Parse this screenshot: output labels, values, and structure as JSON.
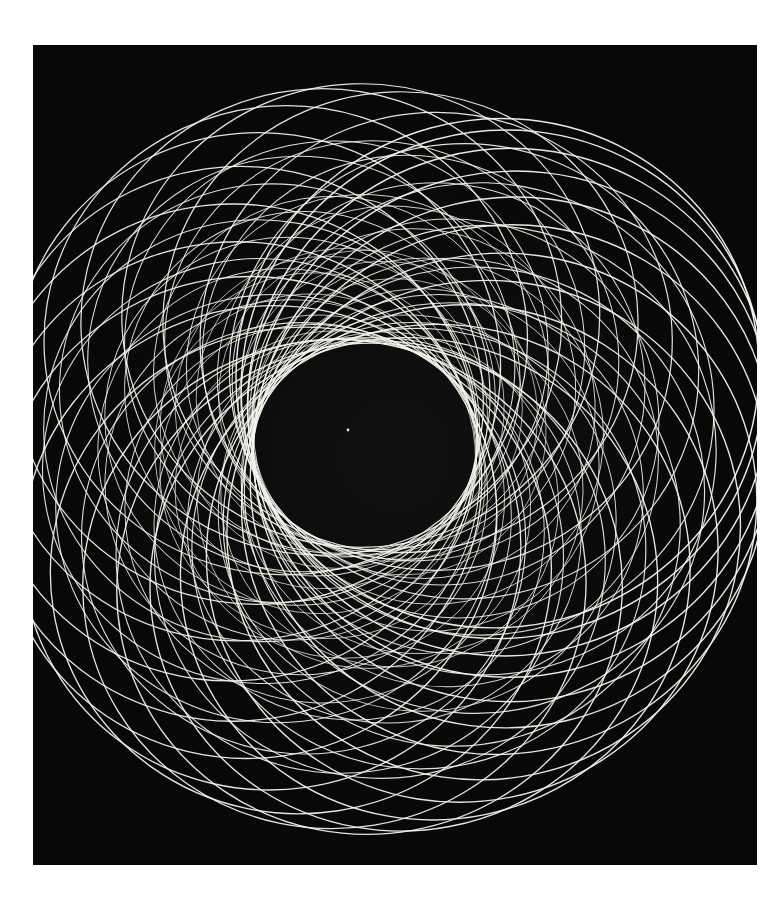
{
  "page": {
    "background_color": "#ffffff",
    "width": 783,
    "height": 897
  },
  "plate": {
    "name": "photographic-print",
    "background_color": "#080808",
    "line_color": "#f5f5f0",
    "x": 33,
    "y": 45,
    "width": 724,
    "height": 820
  },
  "chart_data": {
    "type": "line",
    "title": "",
    "subtitle": "",
    "xlabel": "",
    "ylabel": "",
    "grid": false,
    "legend_position": "none",
    "curve_family": "spiral circle family (epitrochoid envelope)",
    "circle_count": 72,
    "center_x": 362,
    "center_y": 410,
    "center_path_radius_start": 150,
    "center_path_radius_end": 38,
    "circle_radius_start": 262,
    "circle_radius_end": 150,
    "start_angle_deg": -28,
    "total_rotation_deg": 1440,
    "spiral_tightness": 1.35,
    "ellipse_aspect": 0.97,
    "tilt_deg": -14,
    "stroke_width_outer": 1.45,
    "stroke_width_inner": 0.72,
    "opacity_outer": 0.95,
    "opacity_inner": 0.85,
    "inner_void": {
      "cx": 400,
      "cy": 455,
      "rx": 128,
      "ry": 88,
      "rotation_deg": -14
    },
    "pattern_bounds": {
      "left": 63,
      "right": 725,
      "top": 58,
      "bottom": 848
    },
    "speck": {
      "x": 348,
      "y": 430,
      "r": 1.4,
      "color": "#ffffff"
    }
  }
}
